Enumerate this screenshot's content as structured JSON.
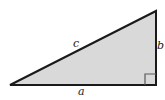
{
  "figure": {
    "name": "right-triangle-diagram",
    "type": "geometric-diagram",
    "background_color": "#ffffff",
    "fill_color": "#d9d9d9",
    "stroke_color": "#1a1a1a",
    "marker_stroke_color": "#595959",
    "stroke_width": 2,
    "width": 165,
    "height": 100,
    "vertices": {
      "left": [
        10,
        85
      ],
      "top_right": [
        156,
        11
      ],
      "bottom_right": [
        156,
        85
      ]
    },
    "right_angle_marker": {
      "x": 145,
      "y": 74,
      "size": 11,
      "corner": "bottom-right"
    }
  },
  "labels": {
    "hypotenuse": "c",
    "vertical_leg": "b",
    "base": "a"
  }
}
